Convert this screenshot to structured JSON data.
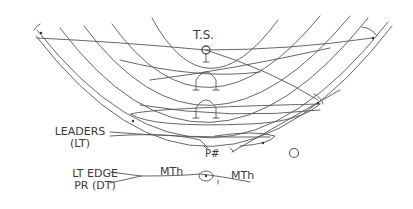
{
  "diagram": {
    "type": "neural circuit schematic",
    "stroke_color": "#555555",
    "labels": {
      "top": "T.S.",
      "leaders_line1": "LEADERS",
      "leaders_line2": "(LT)",
      "edge_line1": "LT EDGE",
      "edge_line2": "PR (DT)",
      "mth_left": "MTh",
      "mth_right": "MTh",
      "p_sharp": "P#",
      "o": "O"
    },
    "nodes": [
      {
        "id": "ts-node",
        "label": "T.S."
      },
      {
        "id": "mth-node",
        "label": "MTh"
      },
      {
        "id": "cell-top-left"
      },
      {
        "id": "cell-top-right"
      },
      {
        "id": "cell-right"
      },
      {
        "id": "cell-left"
      },
      {
        "id": "cell-lower-right"
      }
    ],
    "arch_count": 2,
    "nested_arc_count": 6
  }
}
